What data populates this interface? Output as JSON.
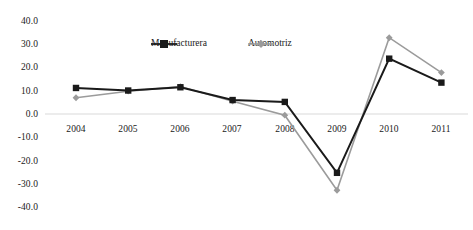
{
  "chart_data": {
    "type": "line",
    "title": "",
    "subtitle": "",
    "xlabel": "",
    "ylabel": "",
    "categories": [
      "2004",
      "2005",
      "2006",
      "2007",
      "2008",
      "2009",
      "2010",
      "2011"
    ],
    "series": [
      {
        "name": "Manufacturera",
        "color": "#1a1a1a",
        "marker": "square",
        "values": [
          11.2,
          10.1,
          11.5,
          6.0,
          5.2,
          -25.3,
          23.8,
          13.5
        ]
      },
      {
        "name": "Automotriz",
        "color": "#9b9b9b",
        "marker": "diamond",
        "values": [
          7.0,
          9.8,
          11.8,
          5.5,
          -0.5,
          -32.8,
          32.8,
          17.8
        ]
      }
    ],
    "ylim": [
      -40.0,
      40.0
    ],
    "ytick_labels": [
      "40.0",
      "30.0",
      "20.0",
      "10.0",
      "0.0",
      "-10.0",
      "-20.0",
      "-30.0",
      "-40.0"
    ],
    "ytick_values": [
      40,
      30,
      20,
      10,
      0,
      -10,
      -20,
      -30,
      -40
    ],
    "grid": false,
    "zero_line": true,
    "zero_line_color": "#d9d9d9",
    "legend_position": "top-center",
    "legend_entries": [
      {
        "label": "Manufacturera",
        "color": "#1a1a1a",
        "marker": "square"
      },
      {
        "label": "Automotriz",
        "color": "#9b9b9b",
        "marker": "diamond"
      }
    ]
  }
}
